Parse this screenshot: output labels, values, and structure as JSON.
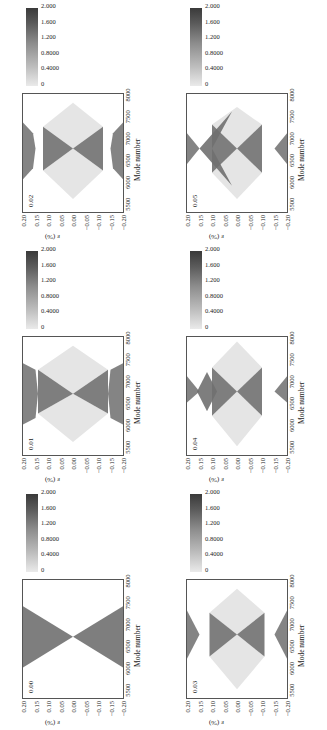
{
  "chart_data": {
    "type": "heatmap",
    "layout": "2 columns x 3 rows, figure rotated 90 degrees counter-clockwise",
    "shared": {
      "xlabel": "Mode number",
      "ylabel": "ε (%)",
      "xticks": [
        "5500",
        "6000",
        "6500",
        "7000",
        "7500",
        "8000"
      ],
      "xlim": [
        5300,
        8000
      ],
      "yticks": [
        "0.20",
        "0.15",
        "0.10",
        "0.05",
        "0.00",
        "−0.05",
        "−0.10",
        "−0.15",
        "−0.20"
      ],
      "ylim": [
        -0.2,
        0.2
      ],
      "colorbar_ticks": [
        "0",
        "0.4000",
        "0.8000",
        "1.200",
        "1.600",
        "2.000"
      ],
      "colorbar_range": [
        0,
        2.0
      ],
      "colormap": "grayscale light-to-dark"
    },
    "panels": [
      {
        "label": "0.02",
        "position": "left-top",
        "description": "X-shaped dark band crossing at ~6750, 0.00; outer dark lobes near ±0.17; faint light diamond envelope 5500–7800"
      },
      {
        "label": "0.01",
        "position": "left-middle",
        "description": "X-shaped band crossing at ~6700, 0.00; outer dark lobes at ±0.15–0.20 between 6000–7400; faint diamond edges"
      },
      {
        "label": "0.00",
        "position": "left-bottom",
        "description": "Pure X-shaped band from (6000,±0.20) to (7400,∓0.20) crossing at ~6700, 0.00"
      },
      {
        "label": "0.05",
        "position": "right-top",
        "description": "Diamond of dark bands with light-gray filled side lobes; crossings near 5600 and 7700 at 0.00; outer dark triangles at ±0.15"
      },
      {
        "label": "0.04",
        "position": "right-middle",
        "description": "Dark X and diamond with light-gray inner lobes; faint diagonal lines to 5400 and 7900"
      },
      {
        "label": "0.03",
        "position": "right-bottom",
        "description": "Dark X with outer lobes near ±0.15 and faint light diamond envelope from 5500 to 7800"
      }
    ]
  },
  "panels": [
    {
      "label": "0.02",
      "xlabel": "Mode number",
      "ylabel": "ε (%)"
    },
    {
      "label": "0.01",
      "xlabel": "Mode number",
      "ylabel": "ε (%)"
    },
    {
      "label": "0.00",
      "xlabel": "Mode number",
      "ylabel": "ε (%)"
    },
    {
      "label": "0.05",
      "xlabel": "Mode number",
      "ylabel": "ε (%)"
    },
    {
      "label": "0.04",
      "xlabel": "Mode number",
      "ylabel": "ε (%)"
    },
    {
      "label": "0.03",
      "xlabel": "Mode number",
      "ylabel": "ε (%)"
    }
  ],
  "axes": {
    "xticks": [
      "5500",
      "6000",
      "6500",
      "7000",
      "7500",
      "8000"
    ],
    "yticks": [
      "0.20",
      "0.15",
      "0.10",
      "0.05",
      "0.00",
      "−0.05",
      "−0.10",
      "−0.15",
      "−0.20"
    ],
    "cticks": [
      "0",
      "0.4000",
      "0.8000",
      "1.200",
      "1.600",
      "2.000"
    ]
  }
}
